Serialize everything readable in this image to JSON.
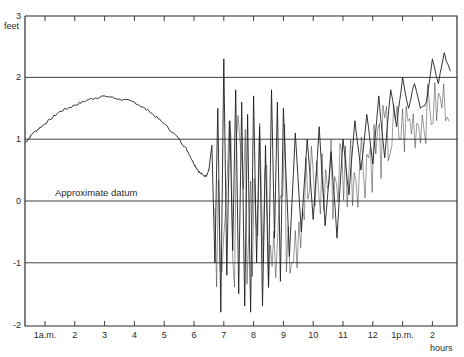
{
  "chart_data": {
    "type": "line",
    "title": "",
    "xlabel": "hours",
    "ylabel": "feet",
    "ylim": [
      -2,
      3
    ],
    "xlim": [
      0.33,
      14.8
    ],
    "grid": {
      "horizontal": [
        2,
        1,
        0,
        -1
      ],
      "vertical": false
    },
    "yticks": [
      {
        "value": 3,
        "label": "3"
      },
      {
        "value": 2,
        "label": "2"
      },
      {
        "value": 1,
        "label": "1"
      },
      {
        "value": 0,
        "label": "0"
      },
      {
        "value": -1,
        "label": "-1"
      },
      {
        "value": -2,
        "label": "-2"
      }
    ],
    "xticks": [
      {
        "value": 1,
        "label": "1a.m."
      },
      {
        "value": 2,
        "label": "2"
      },
      {
        "value": 3,
        "label": "3"
      },
      {
        "value": 4,
        "label": "4"
      },
      {
        "value": 5,
        "label": "5"
      },
      {
        "value": 6,
        "label": "6"
      },
      {
        "value": 7,
        "label": "7"
      },
      {
        "value": 8,
        "label": "8"
      },
      {
        "value": 9,
        "label": "9"
      },
      {
        "value": 10,
        "label": "10"
      },
      {
        "value": 11,
        "label": "11"
      },
      {
        "value": 12,
        "label": "12"
      },
      {
        "value": 13,
        "label": "1p.m."
      },
      {
        "value": 14,
        "label": "2"
      }
    ],
    "annotations": [
      {
        "text": "Approximate datum",
        "x": 1.5,
        "y": 0.1
      }
    ],
    "series": [
      {
        "name": "water level",
        "x": [
          0.35,
          0.6,
          1.0,
          1.5,
          2.0,
          2.5,
          3.0,
          3.5,
          4.0,
          4.5,
          5.0,
          5.5,
          5.8,
          6.0,
          6.2,
          6.4,
          6.5,
          6.6,
          6.7,
          6.8,
          6.9,
          7.0,
          7.1,
          7.2,
          7.3,
          7.4,
          7.5,
          7.6,
          7.7,
          7.8,
          7.9,
          8.0,
          8.1,
          8.2,
          8.3,
          8.4,
          8.5,
          8.6,
          8.7,
          8.8,
          8.9,
          9.0,
          9.2,
          9.4,
          9.6,
          9.8,
          10.0,
          10.2,
          10.4,
          10.6,
          10.8,
          11.0,
          11.2,
          11.4,
          11.6,
          11.8,
          12.0,
          12.2,
          12.4,
          12.6,
          12.8,
          13.0,
          13.2,
          13.4,
          13.6,
          13.8,
          14.0,
          14.2,
          14.4,
          14.6
        ],
        "y": [
          0.95,
          1.1,
          1.25,
          1.45,
          1.55,
          1.65,
          1.7,
          1.65,
          1.6,
          1.45,
          1.25,
          1.0,
          0.8,
          0.6,
          0.45,
          0.4,
          0.5,
          0.9,
          -1.0,
          1.5,
          -1.8,
          2.3,
          -1.2,
          1.3,
          -0.8,
          1.8,
          -1.5,
          1.6,
          -1.7,
          1.4,
          -1.8,
          1.7,
          -1.0,
          1.2,
          -1.7,
          0.9,
          -1.4,
          1.8,
          -0.6,
          1.6,
          -1.3,
          1.5,
          -0.9,
          1.1,
          -0.5,
          1.0,
          -0.3,
          1.2,
          -0.4,
          0.8,
          -0.6,
          1.0,
          0.1,
          1.3,
          0.5,
          1.4,
          0.6,
          1.7,
          0.7,
          1.8,
          1.2,
          2.0,
          1.5,
          1.9,
          1.5,
          1.6,
          2.3,
          1.9,
          2.4,
          2.1
        ]
      }
    ]
  }
}
